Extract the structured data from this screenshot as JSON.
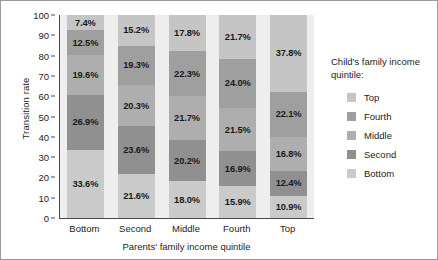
{
  "chart_data": {
    "type": "bar",
    "stacked": true,
    "title": "",
    "xlabel": "Parents' family income quintile",
    "ylabel": "Transition rate",
    "categories": [
      "Bottom",
      "Second",
      "Middle",
      "Fourth",
      "Top"
    ],
    "ylim": [
      0,
      100
    ],
    "yticks": [
      0,
      10,
      20,
      30,
      40,
      50,
      60,
      70,
      80,
      90,
      100
    ],
    "grid": false,
    "legend_position": "right",
    "legend_title": "Child's family income quintile:",
    "stack_order_top_to_bottom": [
      "Top",
      "Fourth",
      "Middle",
      "Second",
      "Bottom"
    ],
    "series": [
      {
        "name": "Top",
        "color": "#c5c5c5",
        "values": [
          7.4,
          15.2,
          17.8,
          21.7,
          37.8
        ],
        "labels": [
          "7.4%",
          "15.2%",
          "17.8%",
          "21.7%",
          "37.8%"
        ]
      },
      {
        "name": "Fourth",
        "color": "#9f9f9f",
        "values": [
          12.5,
          19.3,
          22.3,
          24.0,
          22.1
        ],
        "labels": [
          "12.5%",
          "19.3%",
          "22.3%",
          "24.0%",
          "22.1%"
        ]
      },
      {
        "name": "Middle",
        "color": "#aeaeae",
        "values": [
          19.6,
          20.3,
          21.7,
          21.5,
          16.8
        ],
        "labels": [
          "19.6%",
          "20.3%",
          "21.7%",
          "21.5%",
          "16.8%"
        ]
      },
      {
        "name": "Second",
        "color": "#909090",
        "values": [
          26.9,
          23.6,
          20.2,
          16.9,
          12.4
        ],
        "labels": [
          "26.9%",
          "23.6%",
          "20.2%",
          "16.9%",
          "12.4%"
        ]
      },
      {
        "name": "Bottom",
        "color": "#cacaca",
        "values": [
          33.6,
          21.6,
          18.0,
          15.9,
          10.9
        ],
        "labels": [
          "33.6%",
          "21.6%",
          "18.0%",
          "15.9%",
          "10.9%"
        ]
      }
    ]
  },
  "legend": {
    "title": "Child's family income quintile:",
    "items": [
      {
        "label": "Top",
        "color": "#c5c5c5"
      },
      {
        "label": "Fourth",
        "color": "#9f9f9f"
      },
      {
        "label": "Middle",
        "color": "#aeaeae"
      },
      {
        "label": "Second",
        "color": "#909090"
      },
      {
        "label": "Bottom",
        "color": "#cacaca"
      }
    ]
  },
  "axes": {
    "y_title": "Transition rate",
    "x_title": "Parents' family income quintile",
    "y_tick_labels": [
      "0",
      "10",
      "20",
      "30",
      "40",
      "50",
      "60",
      "70",
      "80",
      "90",
      "100"
    ],
    "x_tick_labels": [
      "Bottom",
      "Second",
      "Middle",
      "Fourth",
      "Top"
    ]
  }
}
